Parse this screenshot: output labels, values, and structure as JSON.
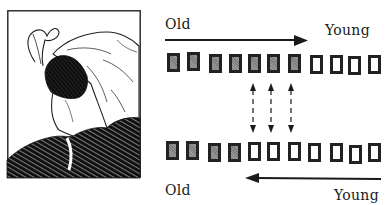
{
  "figure": {
    "illustration": {
      "title": "Ambiguous figure: young woman / old woman",
      "description": "Framed pen-and-ink drawing of a woman in a feathered headscarf and fur coat"
    },
    "top_panel": {
      "label_left": "Old",
      "label_right": "Young",
      "arrow_direction": "right",
      "boxes": [
        {
          "state": "shaded"
        },
        {
          "state": "shaded"
        },
        {
          "state": "shaded"
        },
        {
          "state": "shaded"
        },
        {
          "state": "shaded"
        },
        {
          "state": "shaded"
        },
        {
          "state": "shaded"
        },
        {
          "state": "empty"
        },
        {
          "state": "empty"
        },
        {
          "state": "empty"
        },
        {
          "state": "empty"
        }
      ],
      "box_x": [
        167,
        187,
        209,
        229,
        248,
        267,
        288,
        310,
        330,
        348,
        368
      ],
      "box_y": [
        53,
        52,
        54,
        54,
        54,
        54,
        54,
        55,
        55,
        56,
        55
      ]
    },
    "connectors": {
      "type": "double-headed dashed arrows",
      "count": 3,
      "x": [
        253,
        271,
        291
      ]
    },
    "bottom_panel": {
      "label_left": "Old",
      "label_right": "Young",
      "arrow_direction": "left",
      "boxes": [
        {
          "state": "shaded"
        },
        {
          "state": "shaded"
        },
        {
          "state": "shaded"
        },
        {
          "state": "shaded"
        },
        {
          "state": "empty"
        },
        {
          "state": "empty"
        },
        {
          "state": "empty"
        },
        {
          "state": "empty"
        },
        {
          "state": "empty"
        },
        {
          "state": "empty"
        },
        {
          "state": "empty"
        }
      ],
      "box_x": [
        166,
        186,
        208,
        228,
        248,
        267,
        288,
        308,
        330,
        349,
        368
      ],
      "box_y": [
        141,
        141,
        143,
        143,
        142,
        142,
        142,
        143,
        143,
        145,
        143
      ]
    },
    "colors": {
      "ink": "#1a1a1a",
      "shaded_fill": "#8c8c8c",
      "background": "#ffffff"
    }
  }
}
